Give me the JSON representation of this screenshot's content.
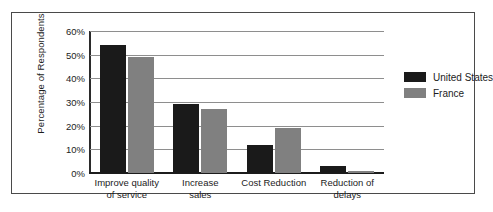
{
  "chart_data": {
    "type": "bar",
    "title": "",
    "xlabel": "",
    "ylabel": "Percentage of Respondents",
    "categories": [
      "Improve quality\nof service",
      "Increase\nsales",
      "Cost Reduction",
      "Reduction of\ndelays"
    ],
    "series": [
      {
        "name": "United States",
        "color": "#1a1a1a",
        "values": [
          54,
          29,
          12,
          3
        ]
      },
      {
        "name": "France",
        "color": "#808080",
        "values": [
          49,
          27,
          19,
          1
        ]
      }
    ],
    "ylim": [
      0,
      60
    ],
    "yticks": [
      0,
      10,
      20,
      30,
      40,
      50,
      60
    ],
    "ytick_labels": [
      "0%",
      "10%",
      "20%",
      "30%",
      "40%",
      "50%",
      "60%"
    ],
    "grid": true,
    "legend_position": "right"
  },
  "legend": {
    "entries": [
      {
        "label": "United States",
        "color": "#1a1a1a"
      },
      {
        "label": "France",
        "color": "#808080"
      }
    ]
  }
}
